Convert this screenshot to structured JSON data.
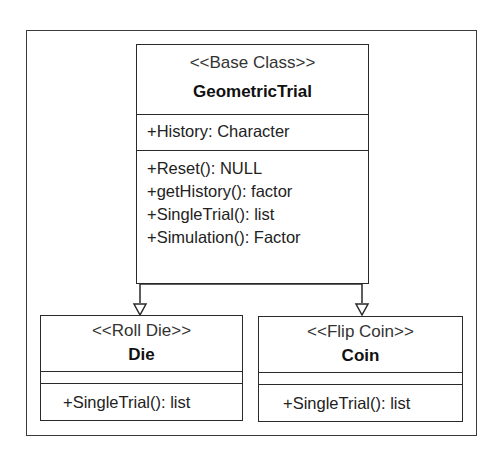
{
  "diagram": {
    "type": "uml-class-diagram",
    "base_class": {
      "stereotype": "<<Base Class>>",
      "name": "GeometricTrial",
      "attributes": [
        "+History: Character"
      ],
      "methods": [
        "+Reset(): NULL",
        "+getHistory(): factor",
        "+SingleTrial(): list",
        "+Simulation(): Factor"
      ]
    },
    "subclasses": [
      {
        "stereotype": "<<Roll Die>>",
        "name": "Die",
        "attributes": [],
        "methods": [
          "+SingleTrial(): list"
        ]
      },
      {
        "stereotype": "<<Flip Coin>>",
        "name": "Coin",
        "attributes": [],
        "methods": [
          "+SingleTrial(): list"
        ]
      }
    ],
    "relationships": [
      {
        "from": "Die",
        "to": "GeometricTrial",
        "kind": "inheritance"
      },
      {
        "from": "Coin",
        "to": "GeometricTrial",
        "kind": "inheritance"
      }
    ]
  }
}
